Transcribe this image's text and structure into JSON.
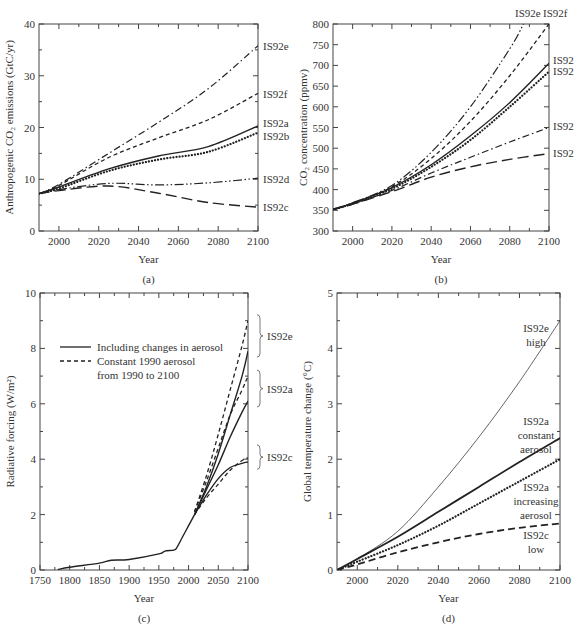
{
  "chart_data": [
    {
      "id": "a",
      "type": "line",
      "panel_label": "(a)",
      "title": "",
      "xlabel": "Year",
      "ylabel": "Anthropogenic CO₂ emissions (GtC/yr)",
      "xlim": [
        1990,
        2100
      ],
      "ylim": [
        0,
        40
      ],
      "xticks": [
        2000,
        2020,
        2040,
        2060,
        2080,
        2100
      ],
      "yticks": [
        0,
        10,
        20,
        30,
        40
      ],
      "grid": false,
      "box": {
        "left": 39,
        "top": 24,
        "right": 258,
        "bottom": 231
      },
      "series": [
        {
          "name": "IS92e",
          "style": "dashdot",
          "x": [
            1990,
            2000,
            2025,
            2050,
            2075,
            2100
          ],
          "y": [
            7.2,
            9.0,
            15.0,
            21.0,
            27.5,
            35.8
          ]
        },
        {
          "name": "IS92f",
          "style": "dashed",
          "x": [
            1990,
            2000,
            2025,
            2050,
            2075,
            2100
          ],
          "y": [
            7.2,
            8.8,
            14.2,
            18.0,
            21.5,
            26.6
          ]
        },
        {
          "name": "IS92a",
          "style": "solid",
          "x": [
            1990,
            2000,
            2025,
            2050,
            2075,
            2100
          ],
          "y": [
            7.2,
            8.5,
            12.0,
            14.5,
            16.3,
            20.3
          ]
        },
        {
          "name": "IS92b",
          "style": "dotted",
          "x": [
            1990,
            2000,
            2025,
            2050,
            2075,
            2100
          ],
          "y": [
            7.2,
            8.2,
            11.6,
            13.8,
            15.3,
            19.0
          ]
        },
        {
          "name": "IS92d",
          "style": "dashdotdot",
          "x": [
            1990,
            2000,
            2025,
            2050,
            2075,
            2100
          ],
          "y": [
            7.2,
            8.0,
            9.2,
            8.9,
            9.3,
            10.2
          ]
        },
        {
          "name": "IS92c",
          "style": "longdash",
          "x": [
            1990,
            2000,
            2025,
            2050,
            2075,
            2100
          ],
          "y": [
            7.2,
            7.8,
            8.7,
            7.3,
            5.5,
            4.6
          ]
        }
      ],
      "labels": [
        {
          "text": "IS92e",
          "x": 263,
          "y": 50
        },
        {
          "text": "IS92f",
          "x": 263,
          "y": 98
        },
        {
          "text": "IS92a",
          "x": 263,
          "y": 127
        },
        {
          "text": "IS92b",
          "x": 263,
          "y": 140
        },
        {
          "text": "IS92d",
          "x": 263,
          "y": 183
        },
        {
          "text": "IS92c",
          "x": 263,
          "y": 211
        }
      ]
    },
    {
      "id": "b",
      "type": "line",
      "panel_label": "(b)",
      "title": "",
      "xlabel": "Year",
      "ylabel": "CO₂ concentration (ppmv)",
      "xlim": [
        1990,
        2100
      ],
      "ylim": [
        300,
        800
      ],
      "xticks": [
        2000,
        2020,
        2040,
        2060,
        2080,
        2100
      ],
      "yticks": [
        300,
        350,
        400,
        450,
        500,
        550,
        600,
        650,
        700,
        750,
        800
      ],
      "grid": false,
      "box": {
        "left": 333,
        "top": 24,
        "right": 549,
        "bottom": 231
      },
      "series": [
        {
          "name": "IS92e",
          "style": "dashdotdot",
          "x": [
            1990,
            2000,
            2020,
            2040,
            2060,
            2080,
            2087
          ],
          "y": [
            352,
            368,
            410,
            490,
            600,
            740,
            800
          ]
        },
        {
          "name": "IS92f",
          "style": "dashed",
          "x": [
            1990,
            2000,
            2020,
            2040,
            2060,
            2080,
            2100
          ],
          "y": [
            352,
            368,
            407,
            475,
            565,
            675,
            800
          ]
        },
        {
          "name": "IS92a",
          "style": "solid",
          "x": [
            1990,
            2000,
            2020,
            2040,
            2060,
            2080,
            2100
          ],
          "y": [
            352,
            367,
            405,
            460,
            530,
            610,
            705
          ]
        },
        {
          "name": "IS92b",
          "style": "dotted",
          "x": [
            1990,
            2000,
            2020,
            2040,
            2060,
            2080,
            2100
          ],
          "y": [
            352,
            366,
            402,
            455,
            520,
            600,
            685
          ]
        },
        {
          "name": "IS92d",
          "style": "dashdot",
          "x": [
            1990,
            2000,
            2020,
            2040,
            2060,
            2080,
            2100
          ],
          "y": [
            352,
            365,
            398,
            440,
            478,
            515,
            550
          ]
        },
        {
          "name": "IS92c",
          "style": "longdash",
          "x": [
            1990,
            2000,
            2020,
            2040,
            2060,
            2080,
            2100
          ],
          "y": [
            352,
            365,
            395,
            430,
            455,
            473,
            487
          ]
        }
      ],
      "labels": [
        {
          "text": "IS92e",
          "x": 515,
          "y": 17
        },
        {
          "text": "IS92f",
          "x": 543,
          "y": 17
        },
        {
          "text": "IS92",
          "x": 553,
          "y": 64
        },
        {
          "text": "IS92",
          "x": 553,
          "y": 75
        },
        {
          "text": "IS92",
          "x": 553,
          "y": 130
        },
        {
          "text": "IS92",
          "x": 553,
          "y": 157
        }
      ]
    },
    {
      "id": "c",
      "type": "line",
      "panel_label": "(c)",
      "title": "",
      "xlabel": "Year",
      "ylabel": "Radiative forcing (W/m²)",
      "xlim": [
        1750,
        2100
      ],
      "ylim": [
        0,
        10
      ],
      "xticks": [
        1750,
        1800,
        1850,
        1900,
        1950,
        2000,
        2050,
        2100
      ],
      "yticks": [
        0,
        2,
        4,
        6,
        8,
        10
      ],
      "grid": false,
      "box": {
        "left": 40,
        "top": 293,
        "right": 248,
        "bottom": 570
      },
      "legend": {
        "position": "upper left",
        "entries": [
          {
            "style": "solid",
            "label": "Including changes in aerosol"
          },
          {
            "style": "dashed",
            "label": "Constant 1990 aerosol",
            "label2": "from 1990 to 2100"
          }
        ]
      },
      "series": [
        {
          "name": "Historical",
          "style": "solid",
          "x": [
            1780,
            1800,
            1850,
            1870,
            1900,
            1950,
            1960,
            1975,
            1980,
            1990,
            2000,
            2010
          ],
          "y": [
            0.02,
            0.1,
            0.25,
            0.35,
            0.38,
            0.58,
            0.68,
            0.72,
            0.8,
            1.2,
            1.6,
            2.0
          ]
        },
        {
          "name": "IS92e aerosol",
          "style": "solid",
          "x": [
            2010,
            2030,
            2050,
            2070,
            2090,
            2100
          ],
          "y": [
            2.0,
            3.0,
            4.2,
            5.6,
            7.0,
            7.9
          ]
        },
        {
          "name": "IS92e constant",
          "style": "dashed",
          "x": [
            2010,
            2030,
            2050,
            2070,
            2090,
            2100
          ],
          "y": [
            2.1,
            3.4,
            4.9,
            6.5,
            8.1,
            9.0
          ]
        },
        {
          "name": "IS92a aerosol",
          "style": "solid",
          "x": [
            2010,
            2030,
            2050,
            2070,
            2090,
            2100
          ],
          "y": [
            2.0,
            2.9,
            3.8,
            4.8,
            5.7,
            6.1
          ]
        },
        {
          "name": "IS92a constant",
          "style": "dashed",
          "x": [
            2010,
            2030,
            2050,
            2070,
            2090,
            2100
          ],
          "y": [
            2.1,
            3.2,
            4.4,
            5.6,
            6.5,
            7.0
          ]
        },
        {
          "name": "IS92c aerosol",
          "style": "solid",
          "x": [
            2010,
            2030,
            2050,
            2070,
            2090,
            2100
          ],
          "y": [
            2.0,
            2.7,
            3.3,
            3.7,
            3.85,
            3.9
          ]
        },
        {
          "name": "IS92c constant",
          "style": "dashed",
          "x": [
            2010,
            2030,
            2050,
            2070,
            2090,
            2100
          ],
          "y": [
            2.0,
            2.6,
            3.1,
            3.6,
            3.95,
            4.05
          ]
        }
      ],
      "braces": [
        {
          "text": "IS92e",
          "y_from": 7.9,
          "y_to": 9.0
        },
        {
          "text": "IS92a",
          "y_from": 6.1,
          "y_to": 7.0
        },
        {
          "text": "IS92c",
          "y_from": 3.85,
          "y_to": 4.3
        }
      ]
    },
    {
      "id": "d",
      "type": "line",
      "panel_label": "(d)",
      "title": "",
      "xlabel": "Year",
      "ylabel": "Global temperature change (°C)",
      "xlim": [
        1990,
        2100
      ],
      "ylim": [
        0,
        5
      ],
      "xticks": [
        2000,
        2020,
        2040,
        2060,
        2080,
        2100
      ],
      "yticks": [
        0,
        1,
        2,
        3,
        4,
        5
      ],
      "grid": false,
      "box": {
        "left": 337,
        "top": 293,
        "right": 560,
        "bottom": 570
      },
      "series": [
        {
          "name": "IS92e high",
          "style": "thin",
          "x": [
            1990,
            2000,
            2020,
            2040,
            2060,
            2080,
            2100
          ],
          "y": [
            0,
            0.2,
            0.7,
            1.5,
            2.4,
            3.4,
            4.5
          ]
        },
        {
          "name": "IS92a constant aerosol",
          "style": "thick",
          "x": [
            1990,
            2000,
            2020,
            2040,
            2060,
            2080,
            2100
          ],
          "y": [
            0,
            0.2,
            0.6,
            1.05,
            1.5,
            1.95,
            2.38
          ]
        },
        {
          "name": "IS92a increasing aerosol",
          "style": "dotted",
          "x": [
            1990,
            2000,
            2020,
            2040,
            2060,
            2080,
            2100
          ],
          "y": [
            0,
            0.15,
            0.45,
            0.8,
            1.2,
            1.6,
            2.0
          ]
        },
        {
          "name": "IS92c low",
          "style": "thickdash",
          "x": [
            1990,
            2000,
            2020,
            2040,
            2060,
            2080,
            2100
          ],
          "y": [
            0,
            0.1,
            0.32,
            0.5,
            0.65,
            0.76,
            0.84
          ]
        }
      ],
      "labels": [
        {
          "lines": [
            "IS92e",
            "high"
          ],
          "x": 536,
          "y": 332
        },
        {
          "lines": [
            "IS92a",
            "constant",
            "aerosol"
          ],
          "x": 536,
          "y": 425
        },
        {
          "lines": [
            "IS92a",
            "increasing",
            "aerosol"
          ],
          "x": 536,
          "y": 491
        },
        {
          "lines": [
            "IS92c",
            "low"
          ],
          "x": 536,
          "y": 539
        }
      ]
    }
  ]
}
